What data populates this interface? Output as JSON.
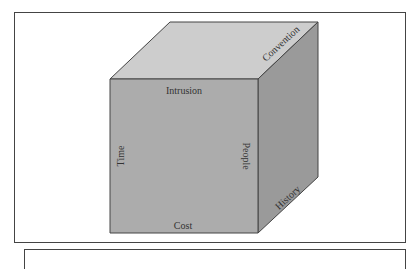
{
  "figure": {
    "type": "cube-diagram",
    "face_colors": {
      "front": "#acacac",
      "top": "#cdcdcd",
      "side": "#9a9a9a",
      "edge": "#444444"
    },
    "labels": {
      "front_top": "Intrusion",
      "front_left": "Time",
      "front_right": "People",
      "front_bottom": "Cost",
      "top_right_edge": "Convention",
      "side_bottom_edge": "History"
    }
  }
}
